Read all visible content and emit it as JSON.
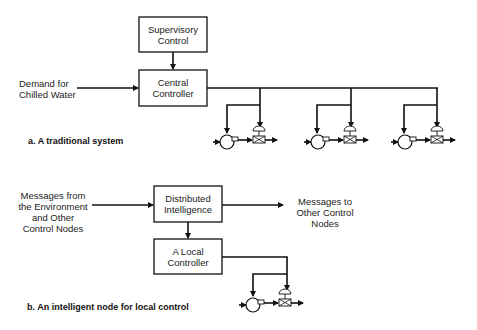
{
  "section_a": {
    "caption": "a. A traditional system",
    "supervisory_box": "Supervisory\nControl",
    "central_box": "Central\nController",
    "input_label": "Demand for\nChilled Water",
    "units": 3
  },
  "section_b": {
    "caption": "b. An intelligent node for local control",
    "distributed_box": "Distributed\nIntelligence",
    "local_box": "A  Local\nController",
    "input_label": "Messages from\nthe Environment\nand Other\nControl Nodes",
    "output_label": "Messages to\nOther Control\nNodes",
    "units": 1
  },
  "colors": {
    "line": "#111111",
    "box_border": "#111111",
    "text": "#222222"
  }
}
